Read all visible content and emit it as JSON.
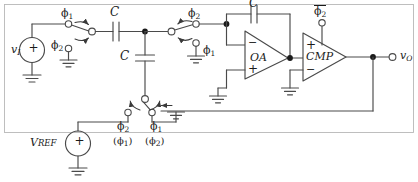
{
  "diagram": {
    "stroke_color": "#4a4a4a",
    "text_color": "#1a1a1a",
    "background": "#ffffff"
  },
  "labels": {
    "v_in": "v",
    "v_in_sub": "I",
    "v_out": "v",
    "v_out_sub": "O",
    "vref": "V",
    "vref_sub": "REF",
    "cap_series": "C",
    "cap_shunt": "C",
    "cap_feedback": "C",
    "opamp": "OA",
    "comparator": "CMP",
    "phi1_sw1": "ϕ",
    "phi1_sw1_sub": "1",
    "phi2_sw1": "ϕ",
    "phi2_sw1_sub": "2",
    "phi2_sw2": "ϕ",
    "phi2_sw2_sub": "2",
    "phi1_sw2": "ϕ",
    "phi1_sw2_sub": "1",
    "phi2_bar": "ϕ",
    "phi2_bar_sub": "2",
    "bot_left_top": "ϕ",
    "bot_left_top_sub": "2",
    "bot_left_bottom": "(ϕ",
    "bot_left_bottom_sub": "1",
    "bot_left_bottom_tail": ")",
    "bot_right_top": "ϕ",
    "bot_right_top_sub": "1",
    "bot_right_bottom": "(ϕ",
    "bot_right_bottom_sub": "2",
    "bot_right_bottom_tail": ")",
    "plus_source_in": "+",
    "plus_source_ref": "+",
    "opamp_minus": "−",
    "opamp_plus": "+",
    "cmp_plus": "+",
    "cmp_minus": "−"
  },
  "components": [
    {
      "name": "input-voltage-source",
      "type": "voltage-source",
      "label": "v_I"
    },
    {
      "name": "reference-voltage-source",
      "type": "voltage-source",
      "label": "V_REF"
    },
    {
      "name": "switch-input",
      "type": "spdt-switch",
      "throws": [
        "phi1",
        "phi2"
      ]
    },
    {
      "name": "switch-mid",
      "type": "spdt-switch",
      "throws": [
        "phi2",
        "phi1"
      ]
    },
    {
      "name": "switch-bottom",
      "type": "spdt-switch",
      "throws": [
        "phi2 (phi1)",
        "phi1 (phi2)"
      ]
    },
    {
      "name": "capacitor-series",
      "type": "capacitor",
      "label": "C"
    },
    {
      "name": "capacitor-shunt",
      "type": "capacitor",
      "label": "C"
    },
    {
      "name": "capacitor-feedback",
      "type": "capacitor",
      "label": "C"
    },
    {
      "name": "operational-amplifier",
      "type": "opamp",
      "label": "OA"
    },
    {
      "name": "comparator",
      "type": "comparator",
      "label": "CMP"
    },
    {
      "name": "output-terminal",
      "type": "terminal",
      "label": "v_O"
    }
  ]
}
